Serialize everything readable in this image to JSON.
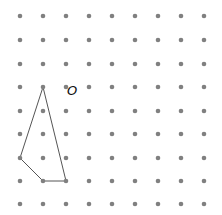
{
  "diagram": {
    "type": "dot-grid-with-polygon",
    "grid": {
      "columns": 9,
      "rows": 9,
      "x_positions": [
        20,
        43,
        66,
        89,
        112,
        135,
        158,
        181,
        204
      ],
      "y_positions": [
        16,
        40,
        64,
        87,
        111,
        134,
        158,
        181,
        204
      ],
      "dot_color": "#808080",
      "dot_radius": 2.3
    },
    "polygon": {
      "grid_vertices": [
        [
          1,
          3
        ],
        [
          0,
          6
        ],
        [
          1,
          7
        ],
        [
          2,
          7
        ]
      ],
      "stroke_color": "#555555",
      "stroke_width": 1
    },
    "point_label": {
      "text": "O",
      "grid_point": [
        2,
        3
      ]
    }
  }
}
